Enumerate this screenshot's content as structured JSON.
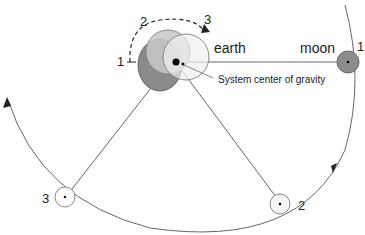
{
  "labels": {
    "earth": "earth",
    "moon": "moon",
    "barycenter": "System center of gravity",
    "earth_pos_1": "1",
    "earth_pos_2": "2",
    "earth_pos_3": "3",
    "moon_pos_1": "1",
    "moon_pos_2": "2",
    "moon_pos_3": "3"
  },
  "colors": {
    "earth_pos1_fill": "#8a8a8a",
    "earth_pos2_fill": "#c8c8c8",
    "earth_pos3_fill": "#f0f0f0",
    "moon_pos1_fill": "#8c8c8c",
    "line": "#555555"
  }
}
